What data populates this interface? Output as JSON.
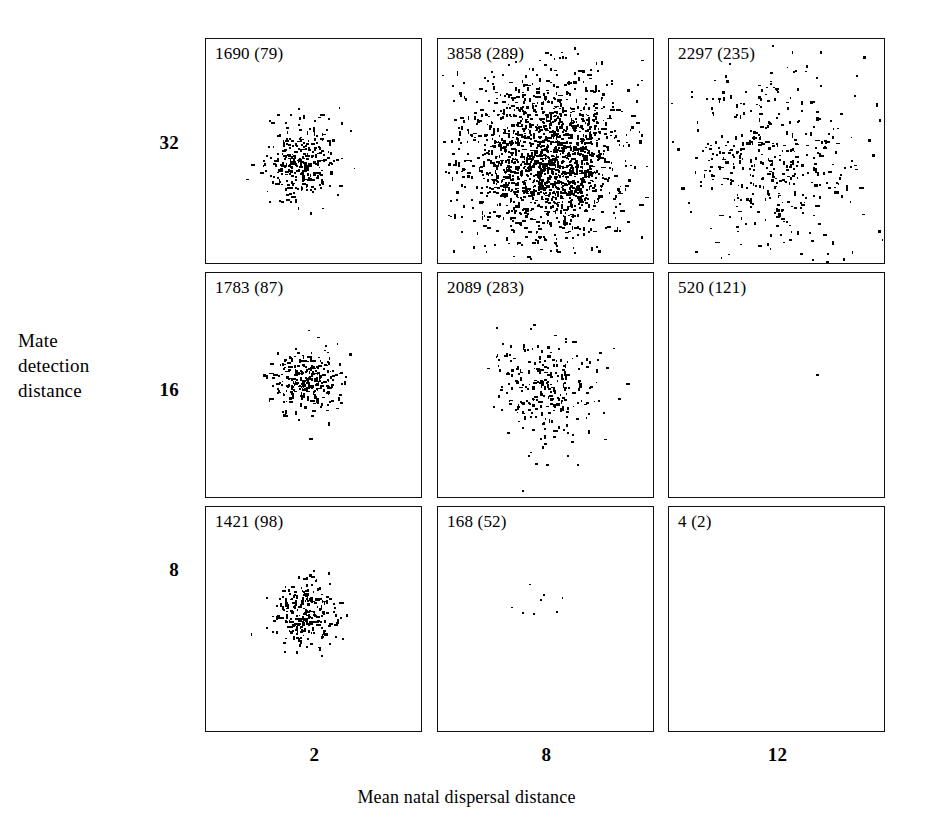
{
  "figure": {
    "x_axis_title": "Mean natal dispersal distance",
    "y_axis_title_lines": [
      "Mate",
      "detection",
      "distance"
    ],
    "y_axis_title_full": "Mate detection distance",
    "row_ticks": [
      "32",
      "16",
      "8"
    ],
    "col_ticks": [
      "2",
      "8",
      "12"
    ],
    "dot_color": "#000000",
    "frame_color": "#111111",
    "background_color": "#ffffff"
  },
  "chart_data": {
    "type": "scatter",
    "title": "",
    "xlabel": "Mean natal dispersal distance",
    "ylabel": "Mate detection distance",
    "grid": false,
    "legend": "none",
    "layout": "3x3 small-multiples lattice",
    "x_categories": [
      2,
      8,
      12
    ],
    "y_categories": [
      32,
      16,
      8
    ],
    "panel_label_format": "population_size (occupied_cells)",
    "panels": [
      {
        "row": 0,
        "col": 0,
        "mate_detection_distance": 32,
        "mean_natal_dispersal_distance": 2,
        "label": "1690 (79)",
        "population_size": 1690,
        "occupied_cells": 79,
        "n_plotted": 300,
        "center_x": 0.44,
        "center_y": 0.54,
        "spread_x": 0.085,
        "spread_y": 0.085,
        "seed": 11
      },
      {
        "row": 0,
        "col": 1,
        "mate_detection_distance": 32,
        "mean_natal_dispersal_distance": 8,
        "label": "3858 (289)",
        "population_size": 3858,
        "occupied_cells": 289,
        "n_plotted": 1650,
        "center_x": 0.5,
        "center_y": 0.54,
        "spread_x": 0.185,
        "spread_y": 0.185,
        "seed": 27
      },
      {
        "row": 0,
        "col": 2,
        "mate_detection_distance": 32,
        "mean_natal_dispersal_distance": 12,
        "label": "2297 (235)",
        "population_size": 2297,
        "occupied_cells": 235,
        "n_plotted": 430,
        "center_x": 0.5,
        "center_y": 0.54,
        "spread_x": 0.2,
        "spread_y": 0.2,
        "seed": 43
      },
      {
        "row": 1,
        "col": 0,
        "mate_detection_distance": 16,
        "mean_natal_dispersal_distance": 2,
        "label": "1783 (87)",
        "population_size": 1783,
        "occupied_cells": 87,
        "n_plotted": 290,
        "center_x": 0.47,
        "center_y": 0.47,
        "spread_x": 0.072,
        "spread_y": 0.072,
        "seed": 59
      },
      {
        "row": 1,
        "col": 1,
        "mate_detection_distance": 16,
        "mean_natal_dispersal_distance": 8,
        "label": "2089 (283)",
        "population_size": 2089,
        "occupied_cells": 283,
        "n_plotted": 260,
        "center_x": 0.5,
        "center_y": 0.5,
        "spread_x": 0.125,
        "spread_y": 0.125,
        "seed": 71
      },
      {
        "row": 1,
        "col": 2,
        "mate_detection_distance": 16,
        "mean_natal_dispersal_distance": 12,
        "label": "520 (121)",
        "population_size": 520,
        "occupied_cells": 121,
        "n_plotted": 2,
        "center_x": 0.45,
        "center_y": 0.5,
        "spread_x": 0.22,
        "spread_y": 0.22,
        "seed": 89
      },
      {
        "row": 2,
        "col": 0,
        "mate_detection_distance": 8,
        "mean_natal_dispersal_distance": 2,
        "label": "1421 (98)",
        "population_size": 1421,
        "occupied_cells": 98,
        "n_plotted": 245,
        "center_x": 0.46,
        "center_y": 0.47,
        "spread_x": 0.078,
        "spread_y": 0.072,
        "seed": 101
      },
      {
        "row": 2,
        "col": 1,
        "mate_detection_distance": 8,
        "mean_natal_dispersal_distance": 8,
        "label": "168 (52)",
        "population_size": 168,
        "occupied_cells": 52,
        "n_plotted": 8,
        "center_x": 0.45,
        "center_y": 0.44,
        "spread_x": 0.075,
        "spread_y": 0.065,
        "seed": 113
      },
      {
        "row": 2,
        "col": 2,
        "mate_detection_distance": 8,
        "mean_natal_dispersal_distance": 12,
        "label": "4 (2)",
        "population_size": 4,
        "occupied_cells": 2,
        "n_plotted": 0,
        "center_x": 0.5,
        "center_y": 0.5,
        "spread_x": 0.12,
        "spread_y": 0.12,
        "seed": 127
      }
    ]
  }
}
